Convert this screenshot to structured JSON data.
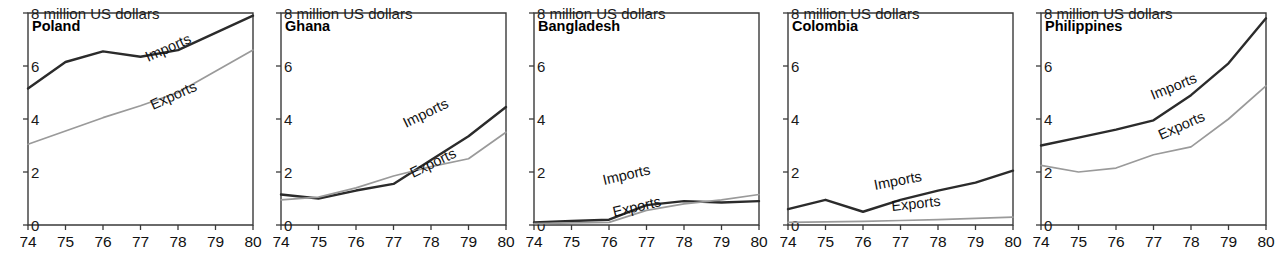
{
  "figure": {
    "panel_count": 5,
    "y_unit_label": "million US dollars",
    "series_names": [
      "Imports",
      "Exports"
    ],
    "colors": {
      "imports": "#2b2b2b",
      "exports": "#9a9a9a",
      "axis": "#3a3a3a",
      "text": "#111111",
      "background": "#ffffff"
    }
  },
  "chart_data": [
    {
      "type": "line",
      "title": "Poland",
      "xlabel": "",
      "ylabel": "million US dollars",
      "unit_note": "8 million US dollars",
      "x": [
        "74",
        "75",
        "76",
        "77",
        "78",
        "79",
        "80"
      ],
      "xlim": [
        74,
        80
      ],
      "ylim": [
        0,
        8
      ],
      "yticks": [
        "0",
        "2",
        "4",
        "6",
        "8"
      ],
      "grid": false,
      "legend": "inline-labels",
      "series": [
        {
          "name": "Imports",
          "values": [
            5.15,
            6.15,
            6.55,
            6.35,
            6.6,
            7.25,
            7.9
          ]
        },
        {
          "name": "Exports",
          "values": [
            3.05,
            3.55,
            4.05,
            4.5,
            5.0,
            5.8,
            6.6
          ]
        }
      ]
    },
    {
      "type": "line",
      "title": "Ghana",
      "xlabel": "",
      "ylabel": "million US dollars",
      "unit_note": "8 million US dollars",
      "x": [
        "74",
        "75",
        "76",
        "77",
        "78",
        "79",
        "80"
      ],
      "xlim": [
        74,
        80
      ],
      "ylim": [
        0,
        8
      ],
      "yticks": [
        "0",
        "2",
        "4",
        "6",
        "8"
      ],
      "grid": false,
      "legend": "inline-labels",
      "series": [
        {
          "name": "Imports",
          "values": [
            1.15,
            1.0,
            1.3,
            1.55,
            2.45,
            3.35,
            4.45
          ]
        },
        {
          "name": "Exports",
          "values": [
            0.95,
            1.05,
            1.4,
            1.85,
            2.2,
            2.5,
            3.5
          ]
        }
      ]
    },
    {
      "type": "line",
      "title": "Bangladesh",
      "xlabel": "",
      "ylabel": "million US dollars",
      "unit_note": "8 million US dollars",
      "x": [
        "74",
        "75",
        "76",
        "77",
        "78",
        "79",
        "80"
      ],
      "xlim": [
        74,
        80
      ],
      "ylim": [
        0,
        8
      ],
      "yticks": [
        "0",
        "2",
        "4",
        "6",
        "8"
      ],
      "grid": false,
      "legend": "inline-labels",
      "series": [
        {
          "name": "Imports",
          "values": [
            0.1,
            0.15,
            0.2,
            0.75,
            0.9,
            0.85,
            0.9
          ]
        },
        {
          "name": "Exports",
          "values": [
            0.05,
            0.08,
            0.1,
            0.55,
            0.8,
            0.95,
            1.15
          ]
        }
      ]
    },
    {
      "type": "line",
      "title": "Colombia",
      "xlabel": "",
      "ylabel": "million US dollars",
      "unit_note": "8 million US dollars",
      "x": [
        "74",
        "75",
        "76",
        "77",
        "78",
        "79",
        "80"
      ],
      "xlim": [
        74,
        80
      ],
      "ylim": [
        0,
        8
      ],
      "yticks": [
        "0",
        "2",
        "4",
        "6",
        "8"
      ],
      "grid": false,
      "legend": "inline-labels",
      "series": [
        {
          "name": "Imports",
          "values": [
            0.6,
            0.95,
            0.5,
            0.95,
            1.3,
            1.6,
            2.05
          ]
        },
        {
          "name": "Exports",
          "values": [
            0.1,
            0.12,
            0.14,
            0.17,
            0.2,
            0.25,
            0.3
          ]
        }
      ]
    },
    {
      "type": "line",
      "title": "Philippines",
      "xlabel": "",
      "ylabel": "million US dollars",
      "unit_note": "8 million US dollars",
      "x": [
        "74",
        "75",
        "76",
        "77",
        "78",
        "79",
        "80"
      ],
      "xlim": [
        74,
        80
      ],
      "ylim": [
        0,
        8
      ],
      "yticks": [
        "0",
        "2",
        "4",
        "6",
        "8"
      ],
      "grid": false,
      "legend": "inline-labels",
      "series": [
        {
          "name": "Imports",
          "values": [
            3.0,
            3.3,
            3.6,
            3.95,
            4.9,
            6.1,
            7.8
          ]
        },
        {
          "name": "Exports",
          "values": [
            2.25,
            2.0,
            2.15,
            2.65,
            2.95,
            4.0,
            5.25
          ]
        }
      ]
    }
  ],
  "panels": [
    {
      "country": "Poland",
      "unit_note": "8 million US dollars",
      "imports_label": "Imports",
      "exports_label": "Exports",
      "xticks": [
        "74",
        "75",
        "76",
        "77",
        "78",
        "79",
        "80"
      ],
      "yticks": [
        "0",
        "2",
        "4",
        "6"
      ]
    },
    {
      "country": "Ghana",
      "unit_note": "8 million US dollars",
      "imports_label": "Imports",
      "exports_label": "Exports",
      "xticks": [
        "74",
        "75",
        "76",
        "77",
        "78",
        "79",
        "80"
      ],
      "yticks": [
        "0",
        "2",
        "4",
        "6"
      ]
    },
    {
      "country": "Bangladesh",
      "unit_note": "8 million US dollars",
      "imports_label": "Imports",
      "exports_label": "Exports",
      "xticks": [
        "74",
        "75",
        "76",
        "77",
        "78",
        "79",
        "80"
      ],
      "yticks": [
        "0",
        "2",
        "4",
        "6"
      ]
    },
    {
      "country": "Colombia",
      "unit_note": "8 million US dollars",
      "imports_label": "Imports",
      "exports_label": "Exports",
      "xticks": [
        "74",
        "75",
        "76",
        "77",
        "78",
        "79",
        "80"
      ],
      "yticks": [
        "0",
        "2",
        "4",
        "6"
      ]
    },
    {
      "country": "Philippines",
      "unit_note": "8 million US dollars",
      "imports_label": "Imports",
      "exports_label": "Exports",
      "xticks": [
        "74",
        "75",
        "76",
        "77",
        "78",
        "79",
        "80"
      ],
      "yticks": [
        "0",
        "2",
        "4",
        "6"
      ]
    }
  ]
}
